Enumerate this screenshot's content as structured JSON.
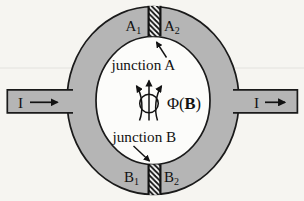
{
  "figure": {
    "background": "#f6f5f1",
    "ring_fill": "#b5b5b5",
    "inner_fill": "#fcfcfa",
    "outline": "#1a1a1a",
    "barrier_fill": "#ffffff",
    "scanline": "#e3e2de"
  },
  "terminals": {
    "a1": {
      "main": "A",
      "sub": "1"
    },
    "a2": {
      "main": "A",
      "sub": "2"
    },
    "b1": {
      "main": "B",
      "sub": "1"
    },
    "b2": {
      "main": "B",
      "sub": "2"
    }
  },
  "annotations": {
    "junction_a": "junction A",
    "junction_b": "junction B",
    "flux_prefix": "Φ(",
    "flux_b": "B",
    "flux_suffix": ")"
  },
  "currents": {
    "left": "I",
    "right": "I"
  },
  "icons": {
    "flux_icon": "magnetic-flux-lines-through-loop",
    "arrow_icon": "right-arrow"
  }
}
